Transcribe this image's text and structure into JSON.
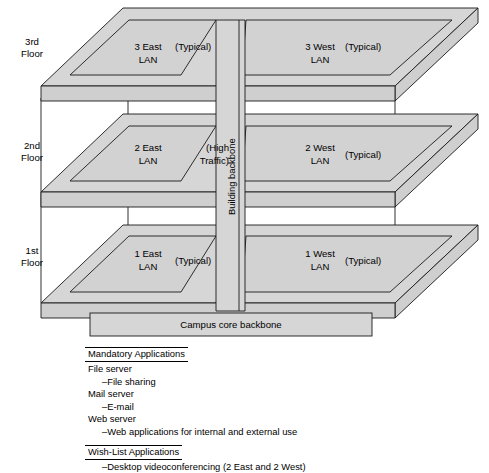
{
  "diagram": {
    "colors": {
      "slab_fill": "#d6d6d6",
      "lan_fill": "#d2d2d2",
      "stroke": "#1a1a1a",
      "background": "#ffffff"
    },
    "floors": [
      {
        "id": "floor-3",
        "label_line1": "3rd",
        "label_line2": "Floor"
      },
      {
        "id": "floor-2",
        "label_line1": "2nd",
        "label_line2": "Floor"
      },
      {
        "id": "floor-1",
        "label_line1": "1st",
        "label_line2": "Floor"
      }
    ],
    "lans": [
      {
        "id": "lan-3-east",
        "name_line1": "3 East",
        "name_line2": "LAN",
        "note_line1": "(Typical)",
        "note_line2": ""
      },
      {
        "id": "lan-3-west",
        "name_line1": "3 West",
        "name_line2": "LAN",
        "note_line1": "(Typical)",
        "note_line2": ""
      },
      {
        "id": "lan-2-east",
        "name_line1": "2 East",
        "name_line2": "LAN",
        "note_line1": "(High",
        "note_line2": "Traffic)"
      },
      {
        "id": "lan-2-west",
        "name_line1": "2 West",
        "name_line2": "LAN",
        "note_line1": "(Typical)",
        "note_line2": ""
      },
      {
        "id": "lan-1-east",
        "name_line1": "1 East",
        "name_line2": "LAN",
        "note_line1": "(Typical)",
        "note_line2": ""
      },
      {
        "id": "lan-1-west",
        "name_line1": "1 West",
        "name_line2": "LAN",
        "note_line1": "(Typical)",
        "note_line2": ""
      }
    ],
    "building_backbone_label": "Building backbone",
    "campus_core_backbone_label": "Campus core backbone"
  },
  "applications": {
    "mandatory_heading": "Mandatory Applications",
    "mandatory_items": [
      {
        "text": "File server",
        "indent": false
      },
      {
        "text": "–File sharing",
        "indent": true
      },
      {
        "text": "Mail server",
        "indent": false
      },
      {
        "text": "–E-mail",
        "indent": true
      },
      {
        "text": "Web server",
        "indent": false
      },
      {
        "text": "–Web applications for internal and external use",
        "indent": true
      }
    ],
    "wishlist_heading": "Wish-List Applications",
    "wishlist_items": [
      {
        "text": "–Desktop videoconferencing (2 East and 2 West)",
        "indent": true
      }
    ]
  }
}
